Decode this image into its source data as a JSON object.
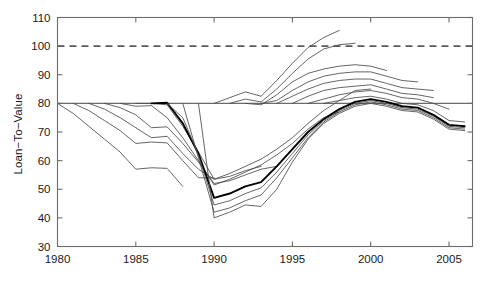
{
  "chart_data": {
    "type": "line",
    "title": "",
    "xlabel": "",
    "ylabel": "Loan−To−Value",
    "xlim": [
      1980,
      2006.5
    ],
    "ylim": [
      30,
      110
    ],
    "xticks": [
      1980,
      1985,
      1990,
      1995,
      2000,
      2005
    ],
    "xticklabels": [
      "1980",
      "1985",
      "1990",
      "1995",
      "2000",
      "2005"
    ],
    "yticks": [
      30,
      40,
      50,
      60,
      70,
      80,
      90,
      100,
      110
    ],
    "yticklabels": [
      "30",
      "40",
      "50",
      "60",
      "70",
      "80",
      "90",
      "100",
      "110"
    ],
    "grid": false,
    "legend": "none",
    "reference_lines": [
      {
        "name": "full-value-line",
        "y": 100,
        "style": "dashed",
        "color": "#5a5a5a"
      },
      {
        "name": "original-ltv-line",
        "y": 80,
        "style": "solid",
        "color": "#6b6b6b"
      }
    ],
    "series": [
      {
        "name": "cohort-1980",
        "emphasis": "normal",
        "x": [
          1980,
          1981,
          1982,
          1983,
          1984,
          1985,
          1986,
          1987,
          1988
        ],
        "values": [
          80.0,
          76.5,
          72.0,
          67.5,
          63.0,
          57.0,
          57.5,
          57.3,
          51.0
        ]
      },
      {
        "name": "cohort-1981",
        "emphasis": "normal",
        "x": [
          1981,
          1982,
          1983,
          1984,
          1985,
          1986,
          1987,
          1988,
          1989,
          1990
        ],
        "values": [
          80.0,
          77.5,
          74.0,
          70.5,
          66.0,
          66.5,
          66.2,
          60.0,
          54.0,
          54.0
        ]
      },
      {
        "name": "cohort-1982",
        "emphasis": "normal",
        "x": [
          1982,
          1983,
          1984,
          1985,
          1986,
          1987,
          1988,
          1989,
          1990,
          1991,
          1992,
          1993
        ],
        "values": [
          80.0,
          78.0,
          75.0,
          71.5,
          68.0,
          68.5,
          62.5,
          57.0,
          53.5,
          54.5,
          56.5,
          58.0
        ]
      },
      {
        "name": "cohort-1983",
        "emphasis": "normal",
        "x": [
          1983,
          1984,
          1985,
          1986,
          1987,
          1988,
          1989,
          1990,
          1991,
          1992,
          1993,
          1994
        ],
        "values": [
          80.0,
          78.5,
          76.0,
          71.5,
          71.8,
          66.0,
          59.5,
          52.0,
          53.0,
          55.0,
          57.0,
          58.0
        ]
      },
      {
        "name": "cohort-1984",
        "emphasis": "normal",
        "x": [
          1984,
          1985,
          1986,
          1987,
          1988,
          1989,
          1990,
          1991,
          1992,
          1993,
          1994,
          1995,
          1996,
          1997,
          1998
        ],
        "values": [
          80.0,
          79.0,
          79.2,
          75.0,
          68.0,
          60.0,
          51.5,
          53.5,
          56.0,
          58.5,
          62.0,
          66.0,
          71.0,
          75.0,
          77.0
        ]
      },
      {
        "name": "cohort-1985",
        "emphasis": "normal",
        "x": [
          1985,
          1986,
          1987,
          1988,
          1989,
          1990,
          1991,
          1992,
          1993,
          1994,
          1995,
          1996,
          1997,
          1998,
          1999,
          2000
        ],
        "values": [
          80.0,
          80.0,
          79.5,
          72.0,
          63.0,
          53.5,
          55.5,
          58.0,
          60.5,
          64.0,
          68.0,
          73.0,
          77.5,
          81.0,
          84.5,
          85.0
        ]
      },
      {
        "name": "cohort-1986",
        "emphasis": "bold",
        "x": [
          1986,
          1987,
          1988,
          1989,
          1990,
          1991,
          1992,
          1993,
          1994,
          1995,
          1996,
          1997,
          1998,
          1999,
          2000,
          2001,
          2002,
          2003,
          2004,
          2005,
          2006
        ],
        "values": [
          80.0,
          80.2,
          73.0,
          62.5,
          47.0,
          48.5,
          51.0,
          52.5,
          58.0,
          64.0,
          70.0,
          74.5,
          78.0,
          80.5,
          81.5,
          80.5,
          79.0,
          78.5,
          76.0,
          72.5,
          72.0
        ]
      },
      {
        "name": "cohort-1987",
        "emphasis": "normal",
        "x": [
          1987,
          1988,
          1989,
          1990,
          1991,
          1992,
          1993,
          1994,
          1995,
          1996,
          1997,
          1998,
          1999,
          2000,
          2001,
          2002,
          2003,
          2004,
          2005,
          2006
        ],
        "values": [
          80.0,
          75.0,
          62.0,
          44.5,
          46.0,
          48.5,
          50.5,
          56.0,
          62.5,
          69.0,
          74.0,
          77.5,
          80.0,
          81.0,
          80.0,
          78.5,
          78.0,
          75.5,
          72.0,
          71.5
        ]
      },
      {
        "name": "cohort-1988",
        "emphasis": "normal",
        "x": [
          1988,
          1989,
          1990,
          1991,
          1992,
          1993,
          1994,
          1995,
          1996,
          1997,
          1998,
          1999,
          2000,
          2001,
          2002,
          2003,
          2004,
          2005,
          2006
        ],
        "values": [
          80.0,
          61.0,
          42.0,
          43.5,
          46.0,
          48.0,
          54.0,
          61.0,
          68.0,
          73.5,
          77.0,
          79.5,
          80.5,
          79.5,
          78.0,
          77.5,
          75.0,
          71.5,
          71.0
        ]
      },
      {
        "name": "cohort-1989",
        "emphasis": "normal",
        "x": [
          1989,
          1990,
          1991,
          1992,
          1993,
          1994,
          1995,
          1996,
          1997,
          1998,
          1999,
          2000,
          2001,
          2002,
          2003,
          2004,
          2005,
          2006
        ],
        "values": [
          80.0,
          40.0,
          42.0,
          44.5,
          44.0,
          50.0,
          59.5,
          67.5,
          73.0,
          76.5,
          79.0,
          80.0,
          79.0,
          77.5,
          77.0,
          74.5,
          71.0,
          70.5
        ]
      },
      {
        "name": "cohort-1990",
        "emphasis": "normal",
        "x": [
          1990,
          1991,
          1992,
          1993,
          1994,
          1995,
          1996,
          1997,
          1998
        ],
        "values": [
          80.0,
          82.0,
          84.0,
          82.5,
          88.0,
          94.0,
          99.5,
          103.0,
          105.5
        ]
      },
      {
        "name": "cohort-1991",
        "emphasis": "normal",
        "x": [
          1991,
          1992,
          1993,
          1994,
          1995,
          1996,
          1997,
          1998,
          1999
        ],
        "values": [
          80.0,
          81.5,
          80.5,
          85.0,
          90.5,
          95.5,
          99.0,
          100.5,
          101.0
        ]
      },
      {
        "name": "cohort-1992",
        "emphasis": "normal",
        "x": [
          1992,
          1993,
          1994,
          1995,
          1996,
          1997,
          1998,
          1999,
          2000,
          2001
        ],
        "values": [
          80.0,
          79.5,
          83.0,
          87.5,
          90.5,
          92.0,
          93.0,
          93.5,
          93.0,
          91.5
        ]
      },
      {
        "name": "cohort-1993",
        "emphasis": "normal",
        "x": [
          1993,
          1994,
          1995,
          1996,
          1997,
          1998,
          1999,
          2000,
          2001,
          2002,
          2003
        ],
        "values": [
          80.0,
          81.0,
          84.5,
          87.5,
          89.5,
          90.5,
          91.0,
          91.0,
          89.5,
          88.0,
          87.5
        ]
      },
      {
        "name": "cohort-1994",
        "emphasis": "normal",
        "x": [
          1994,
          1995,
          1996,
          1997,
          1998,
          1999,
          2000,
          2001,
          2002,
          2003,
          2004
        ],
        "values": [
          80.0,
          82.5,
          85.0,
          87.0,
          88.0,
          88.5,
          88.5,
          87.0,
          85.5,
          85.0,
          84.5
        ]
      },
      {
        "name": "cohort-1995",
        "emphasis": "normal",
        "x": [
          1995,
          1996,
          1997,
          1998,
          1999,
          2000,
          2001,
          2002,
          2003,
          2004
        ],
        "values": [
          80.0,
          82.5,
          84.5,
          85.5,
          86.0,
          86.5,
          85.0,
          83.5,
          83.0,
          82.0
        ]
      },
      {
        "name": "cohort-1996",
        "emphasis": "normal",
        "x": [
          1996,
          1997,
          1998,
          1999,
          2000,
          2001,
          2002,
          2003,
          2004,
          2005
        ],
        "values": [
          80.0,
          81.5,
          83.0,
          84.0,
          84.5,
          83.5,
          82.0,
          81.5,
          80.0,
          78.0
        ]
      },
      {
        "name": "cohort-1997",
        "emphasis": "normal",
        "x": [
          1997,
          1998,
          1999,
          2000,
          2001,
          2002,
          2003,
          2004,
          2005,
          2006
        ],
        "values": [
          80.0,
          81.0,
          82.0,
          82.5,
          81.5,
          80.0,
          79.5,
          77.5,
          74.0,
          73.5
        ]
      }
    ]
  }
}
